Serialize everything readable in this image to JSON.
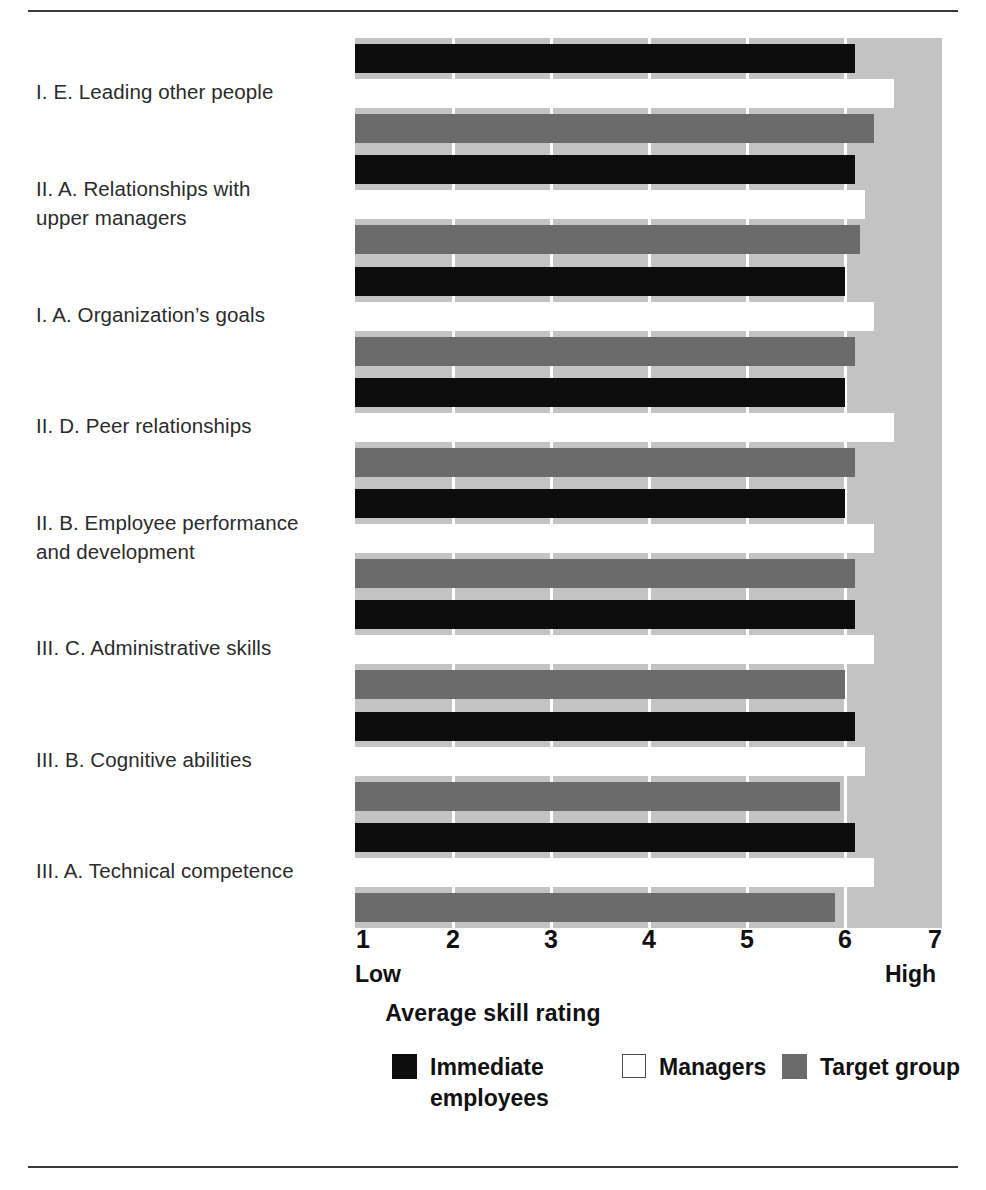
{
  "chart_data": {
    "type": "bar",
    "orientation": "horizontal",
    "title": "",
    "xlabel": "Average skill rating",
    "ylabel": "",
    "xlim": [
      1,
      7
    ],
    "xticks": [
      1,
      2,
      3,
      4,
      5,
      6,
      7
    ],
    "xtick_labels": [
      "1",
      "2",
      "3",
      "4",
      "5",
      "6",
      "7"
    ],
    "axis_endcap_low": "Low",
    "axis_endcap_high": "High",
    "grid": true,
    "legend_position": "bottom",
    "categories": [
      "I. E.  Leading other people",
      "II. A.  Relationships with\nupper managers",
      "I. A.  Organization’s goals",
      "II. D.  Peer relationships",
      "II. B.  Employee performance\nand development",
      "III. C.   Administrative skills",
      "III. B.  Cognitive abilities",
      "III. A.  Technical competence"
    ],
    "series": [
      {
        "name": "Immediate employees",
        "color": "#0d0d0d",
        "values": [
          6.1,
          6.1,
          6.0,
          6.0,
          6.0,
          6.1,
          6.1,
          6.1
        ]
      },
      {
        "name": "Managers",
        "color": "#ffffff",
        "values": [
          6.5,
          6.2,
          6.3,
          6.5,
          6.3,
          6.3,
          6.2,
          6.3
        ]
      },
      {
        "name": "Target group",
        "color": "#6b6b6b",
        "values": [
          6.3,
          6.15,
          6.1,
          6.1,
          6.1,
          6.0,
          5.95,
          5.9
        ]
      }
    ]
  },
  "legend": {
    "items": [
      {
        "label": "Immediate\nemployees",
        "swatch": "immediate"
      },
      {
        "label": "Managers",
        "swatch": "managers"
      },
      {
        "label": "Target group",
        "swatch": "target"
      }
    ]
  },
  "colors": {
    "plot_background": "#c3c3c3",
    "gridline": "#ffffff",
    "immediate": "#0d0d0d",
    "managers": "#ffffff",
    "target": "#6b6b6b",
    "rule": "#3a3a3a"
  }
}
